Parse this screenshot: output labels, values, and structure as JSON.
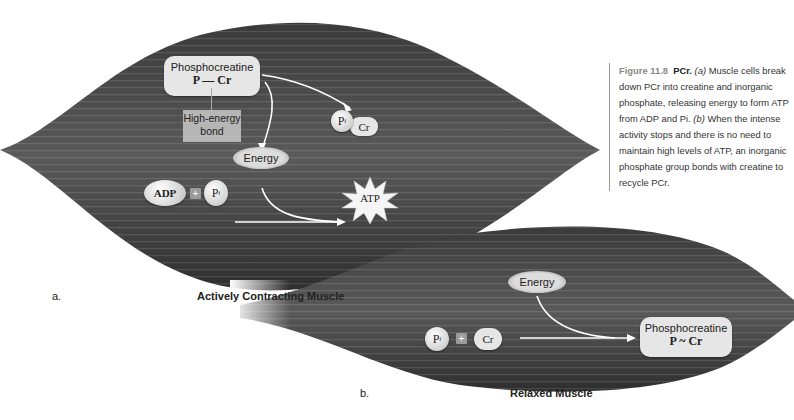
{
  "figure": {
    "number": "Figure 11.8",
    "title": "PCr.",
    "caption_a_marker": "(a)",
    "caption_a": " Muscle cells break down PCr into creatine and inorganic phosphate, releasing energy to form ATP from ADP and Pi. ",
    "caption_b_marker": "(b)",
    "caption_b": " When the intense activity stops and there is no need to maintain high levels of ATP, an inorganic phosphate group bonds with creatine to recycle PCr."
  },
  "panel_a": {
    "letter": "a.",
    "title": "Actively Contracting Muscle",
    "phosphocreatine_label": "Phosphocreatine",
    "phosphocreatine_formula": "P — Cr",
    "bond_label_line1": "High-energy",
    "bond_label_line2": "bond",
    "cr_label": "Cr",
    "pi_label": "P",
    "pi_sub": "i",
    "energy_label": "Energy",
    "adp_label": "ADP",
    "plus": "+",
    "pi2_label": "P",
    "pi2_sub": "i",
    "atp_label": "ATP"
  },
  "panel_b": {
    "letter": "b.",
    "title": "Relaxed Muscle",
    "energy_label": "Energy",
    "pi_label": "P",
    "pi_sub": "i",
    "plus": "+",
    "cr_label": "Cr",
    "phosphocreatine_label": "Phosphocreatine",
    "phosphocreatine_formula": "P ~ Cr"
  }
}
